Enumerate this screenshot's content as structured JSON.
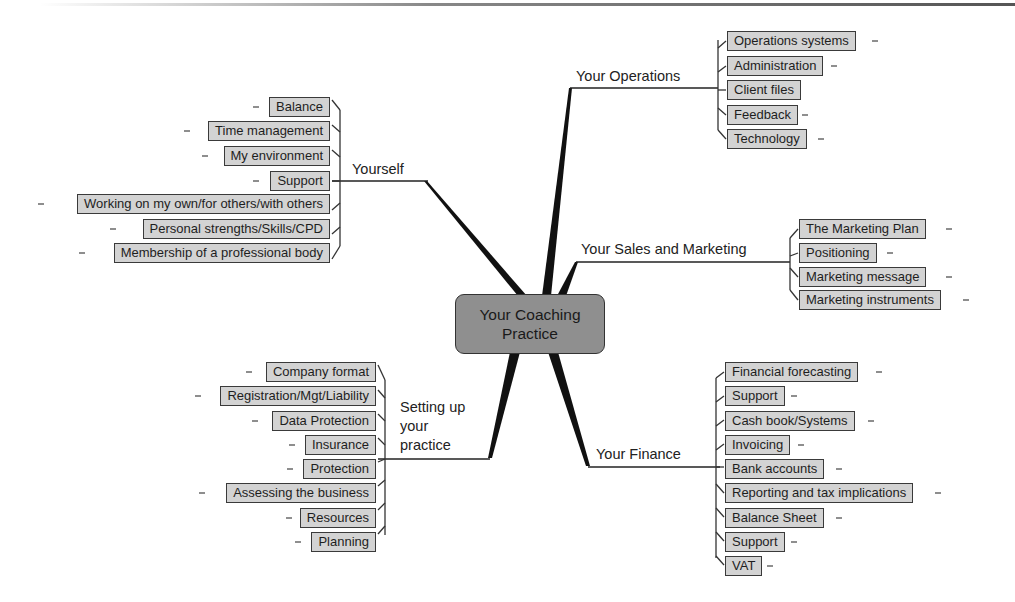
{
  "center": {
    "label_line1": "Your Coaching",
    "label_line2": "Practice"
  },
  "branches": {
    "operations": {
      "label": "Your Operations",
      "items": [
        "Operations systems",
        "Administration",
        "Client files",
        "Feedback",
        "Technology"
      ]
    },
    "yourself": {
      "label": "Yourself",
      "items": [
        "Balance",
        "Time management",
        "My environment",
        "Support",
        "Working on my own/for others/with others",
        "Personal strengths/Skills/CPD",
        "Membership of a professional body"
      ]
    },
    "sales": {
      "label": "Your Sales and Marketing",
      "items": [
        "The Marketing Plan",
        "Positioning",
        "Marketing message",
        "Marketing instruments"
      ]
    },
    "setup": {
      "label_line1": "Setting up",
      "label_line2": "your",
      "label_line3": "practice",
      "items": [
        "Company format",
        "Registration/Mgt/Liability",
        "Data Protection",
        "Insurance",
        "Protection",
        "Assessing the business",
        "Resources",
        "Planning"
      ]
    },
    "finance": {
      "label": "Your Finance",
      "items": [
        "Financial forecasting",
        "Support",
        "Cash book/Systems",
        "Invoicing",
        "Bank accounts",
        "Reporting and tax implications",
        "Balance Sheet",
        "Support",
        "VAT"
      ]
    }
  },
  "colors": {
    "center_fill": "#8f8f8f",
    "leaf_fill": "#d3d3d3",
    "line": "#1a1a1a"
  }
}
